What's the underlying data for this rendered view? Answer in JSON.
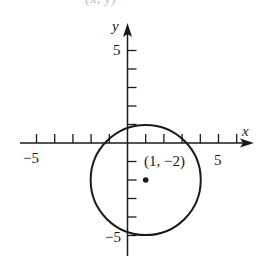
{
  "chart_data": {
    "type": "scatter",
    "title": "",
    "xlabel": "x",
    "ylabel": "y",
    "xlim": [
      -6,
      7
    ],
    "ylim": [
      -6,
      6.2
    ],
    "grid": false,
    "tick_step": 1,
    "x_tick_labels": [
      {
        "value": -5,
        "label": "−5"
      },
      {
        "value": 5,
        "label": "5"
      }
    ],
    "y_tick_labels": [
      {
        "value": 5,
        "label": "5"
      },
      {
        "value": -5,
        "label": "−5"
      }
    ],
    "shapes": [
      {
        "kind": "circle",
        "center": [
          1,
          -2
        ],
        "radius": 3
      }
    ],
    "points": [
      {
        "x": 1,
        "y": -2,
        "label": "(1, −2)"
      }
    ],
    "annotations": [
      "(1, −2)"
    ]
  },
  "labels": {
    "x_axis": "x",
    "y_axis": "y",
    "x_neg5": "−5",
    "x_pos5": "5",
    "y_pos5": "5",
    "y_neg5": "−5",
    "center_point": "(1, −2)",
    "top_cropped_text": "(x, y)"
  }
}
